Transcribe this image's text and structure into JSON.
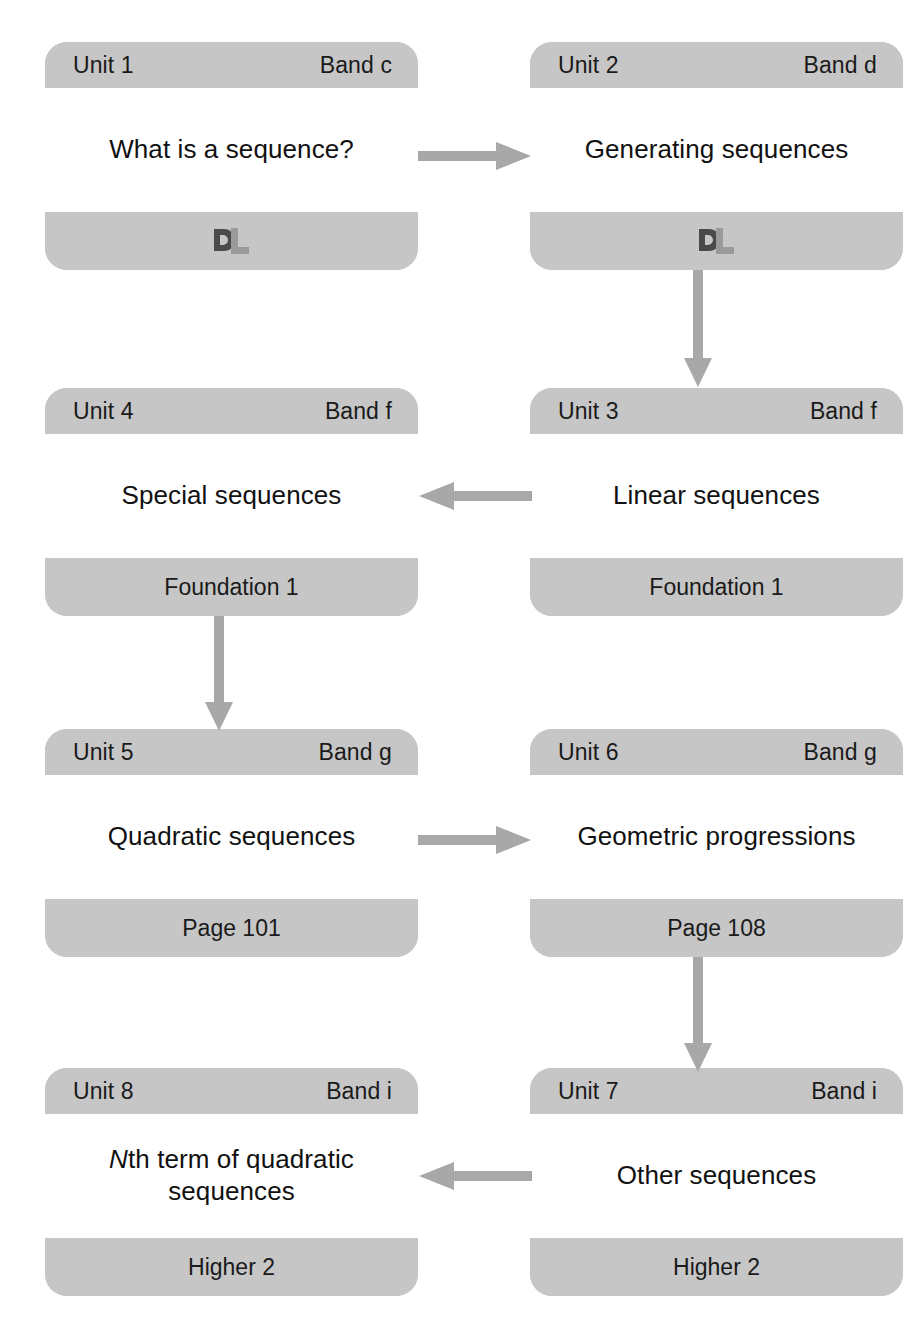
{
  "diagram": {
    "colors": {
      "card_background": "#c6c6c6",
      "card_body": "#ffffff",
      "arrow": "#a8a8a8",
      "text": "#1a1a1a",
      "page_background": "#ffffff"
    },
    "units": [
      {
        "id": "unit-1",
        "unit_label": "Unit 1",
        "band_label": "Band c",
        "title": "What is a sequence?",
        "footer_type": "logo",
        "footer_icon": "dl-monogram-logo",
        "footer_text": ""
      },
      {
        "id": "unit-2",
        "unit_label": "Unit 2",
        "band_label": "Band d",
        "title": "Generating sequences",
        "footer_type": "logo",
        "footer_icon": "dl-monogram-logo",
        "footer_text": ""
      },
      {
        "id": "unit-4",
        "unit_label": "Unit 4",
        "band_label": "Band f",
        "title": "Special sequences",
        "footer_type": "text",
        "footer_icon": "",
        "footer_text": "Foundation 1"
      },
      {
        "id": "unit-3",
        "unit_label": "Unit 3",
        "band_label": "Band f",
        "title": "Linear sequences",
        "footer_type": "text",
        "footer_icon": "",
        "footer_text": "Foundation 1"
      },
      {
        "id": "unit-5",
        "unit_label": "Unit 5",
        "band_label": "Band g",
        "title": "Quadratic sequences",
        "footer_type": "text",
        "footer_icon": "",
        "footer_text": "Page 101"
      },
      {
        "id": "unit-6",
        "unit_label": "Unit 6",
        "band_label": "Band g",
        "title": "Geometric progressions",
        "footer_type": "text",
        "footer_icon": "",
        "footer_text": "Page 108"
      },
      {
        "id": "unit-8",
        "unit_label": "Unit 8",
        "band_label": "Band i",
        "title_prefix_italic": "N",
        "title": "th term of quadratic sequences",
        "footer_type": "text",
        "footer_icon": "",
        "footer_text": "Higher 2"
      },
      {
        "id": "unit-7",
        "unit_label": "Unit 7",
        "band_label": "Band i",
        "title": "Other sequences",
        "footer_type": "text",
        "footer_icon": "",
        "footer_text": "Higher 2"
      }
    ],
    "connectors": [
      {
        "id": "arrow-unit1-to-unit2",
        "from": "unit-1",
        "to": "unit-2",
        "direction": "right"
      },
      {
        "id": "arrow-unit2-to-unit3",
        "from": "unit-2",
        "to": "unit-3",
        "direction": "down"
      },
      {
        "id": "arrow-unit3-to-unit4",
        "from": "unit-3",
        "to": "unit-4",
        "direction": "left"
      },
      {
        "id": "arrow-unit4-to-unit5",
        "from": "unit-4",
        "to": "unit-5",
        "direction": "down"
      },
      {
        "id": "arrow-unit5-to-unit6",
        "from": "unit-5",
        "to": "unit-6",
        "direction": "right"
      },
      {
        "id": "arrow-unit6-to-unit7",
        "from": "unit-6",
        "to": "unit-7",
        "direction": "down"
      },
      {
        "id": "arrow-unit7-to-unit8",
        "from": "unit-7",
        "to": "unit-8",
        "direction": "left"
      }
    ]
  }
}
